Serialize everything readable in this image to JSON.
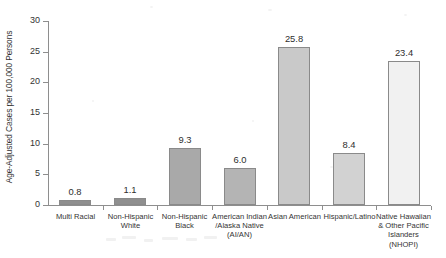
{
  "chart_data": {
    "type": "bar",
    "title": "",
    "xlabel": "",
    "ylabel": "Age-Adjusted Cases per 100,000 Persons",
    "ylim": [
      0,
      30
    ],
    "yticks": [
      0,
      5,
      10,
      15,
      20,
      25,
      30
    ],
    "ytick_labels": [
      "0",
      "5",
      "10",
      "15",
      "20",
      "25",
      "30"
    ],
    "grid": false,
    "legend": "none",
    "categories": [
      "Multi Racial",
      "Non-Hispanic White",
      "Non-Hispanic Black",
      "American Indian /Alaska Native (AI/AN)",
      "Asian American",
      "Hispanic/Latino",
      "Native Hawaiian & Other Pacific Islanders (NHOPI)"
    ],
    "category_label_lines": [
      [
        "Multi Racial"
      ],
      [
        "Non-Hispanic",
        "White"
      ],
      [
        "Non-Hispanic",
        "Black"
      ],
      [
        "American Indian",
        "/Alaska Native",
        "(AI/AN)"
      ],
      [
        "Asian American"
      ],
      [
        "Hispanic/Latino"
      ],
      [
        "Native Hawaiian",
        "& Other Pacific",
        "Islanders",
        "(NHOPI)"
      ]
    ],
    "values": [
      0.8,
      1.1,
      9.3,
      6.0,
      25.8,
      8.4,
      23.4
    ],
    "value_labels": [
      "0.8",
      "1.1",
      "9.3",
      "6.0",
      "25.8",
      "8.4",
      "23.4"
    ],
    "bar_colors": [
      "#8f8f8f",
      "#8f8f8f",
      "#a9a9a9",
      "#b4b4b4",
      "#c9c9c9",
      "#d2d2d2",
      "#f1f1f1"
    ],
    "bar_edge_color": "#8a8a8a"
  }
}
